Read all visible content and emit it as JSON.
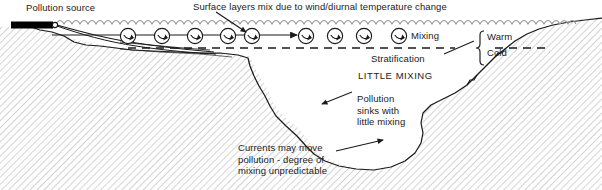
{
  "diagram": {
    "colors": {
      "ink": "#1a1a1a",
      "wave_gray": "#9a9a9a",
      "hatch_gray": "#9b9b9b",
      "background": "#ffffff",
      "outfall_fill": "#000000"
    },
    "labels": {
      "pollution_source": "Pollution source",
      "surface_mix": "Surface layers mix due to wind/diurnal temperature change",
      "mixing": "Mixing",
      "stratification": "Stratification",
      "warm": "Warm",
      "cold": "Cold",
      "little_mixing": "LITTLE MIXING",
      "pollution_sinks": "Pollution\nsinks with\nlittle mixing",
      "currents": "Currents may move\npollution - degree of\nmixing unpredictable"
    },
    "icons": {
      "eddy": "mixing-eddy-icon",
      "flow_arrow": "surface-flow-arrow-icon",
      "outfall": "outfall-pipe-icon",
      "bracket": "warm-cold-bracket-icon"
    },
    "counts": {
      "eddies_in_water": 8,
      "legend_eddies": 1
    }
  }
}
